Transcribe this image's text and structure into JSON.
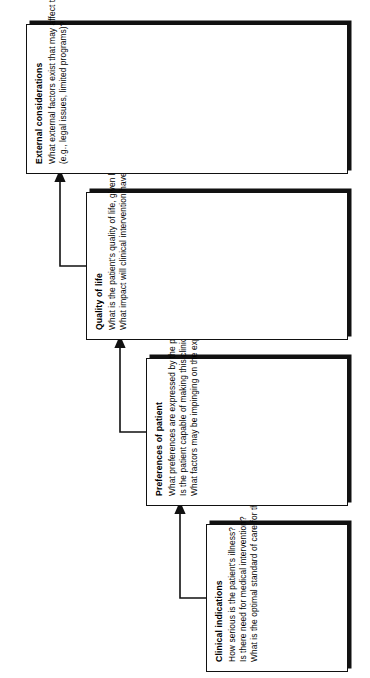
{
  "figure": {
    "type": "staircase-flow-diagram",
    "orientation": "rotated-90-ccw",
    "arrow_count": 3,
    "colors": {
      "stroke": "#111111",
      "fill": "#ffffff",
      "shadow": "#111111",
      "background": "#ffffff"
    }
  },
  "nodes": [
    {
      "id": "clinical-indications",
      "title": "Clinical indications",
      "lines": [
        "How serious is the patient's illness?",
        "Is there need for medical intervention?",
        "What is the optimal standard of care for this patient?"
      ]
    },
    {
      "id": "preferences-of-patient",
      "title": "Preferences of patient",
      "lines": [
        "What preferences are expressed by the patient?",
        "Is the patient capable of making this clinical decision?",
        "What factors may be impinging on the expressed preferences of the patient?"
      ]
    },
    {
      "id": "quality-of-life",
      "title": "Quality of life",
      "lines": [
        "What is the patient's quality of life, given his or her illness process?",
        "What impact will clinical intervention have on the patient's quality of life?"
      ]
    },
    {
      "id": "external-considerations",
      "title": "External considerations",
      "lines": [
        "What external factors exist that may affect the patient's care",
        "(e.g., legal issues, limited programs)?"
      ]
    }
  ]
}
